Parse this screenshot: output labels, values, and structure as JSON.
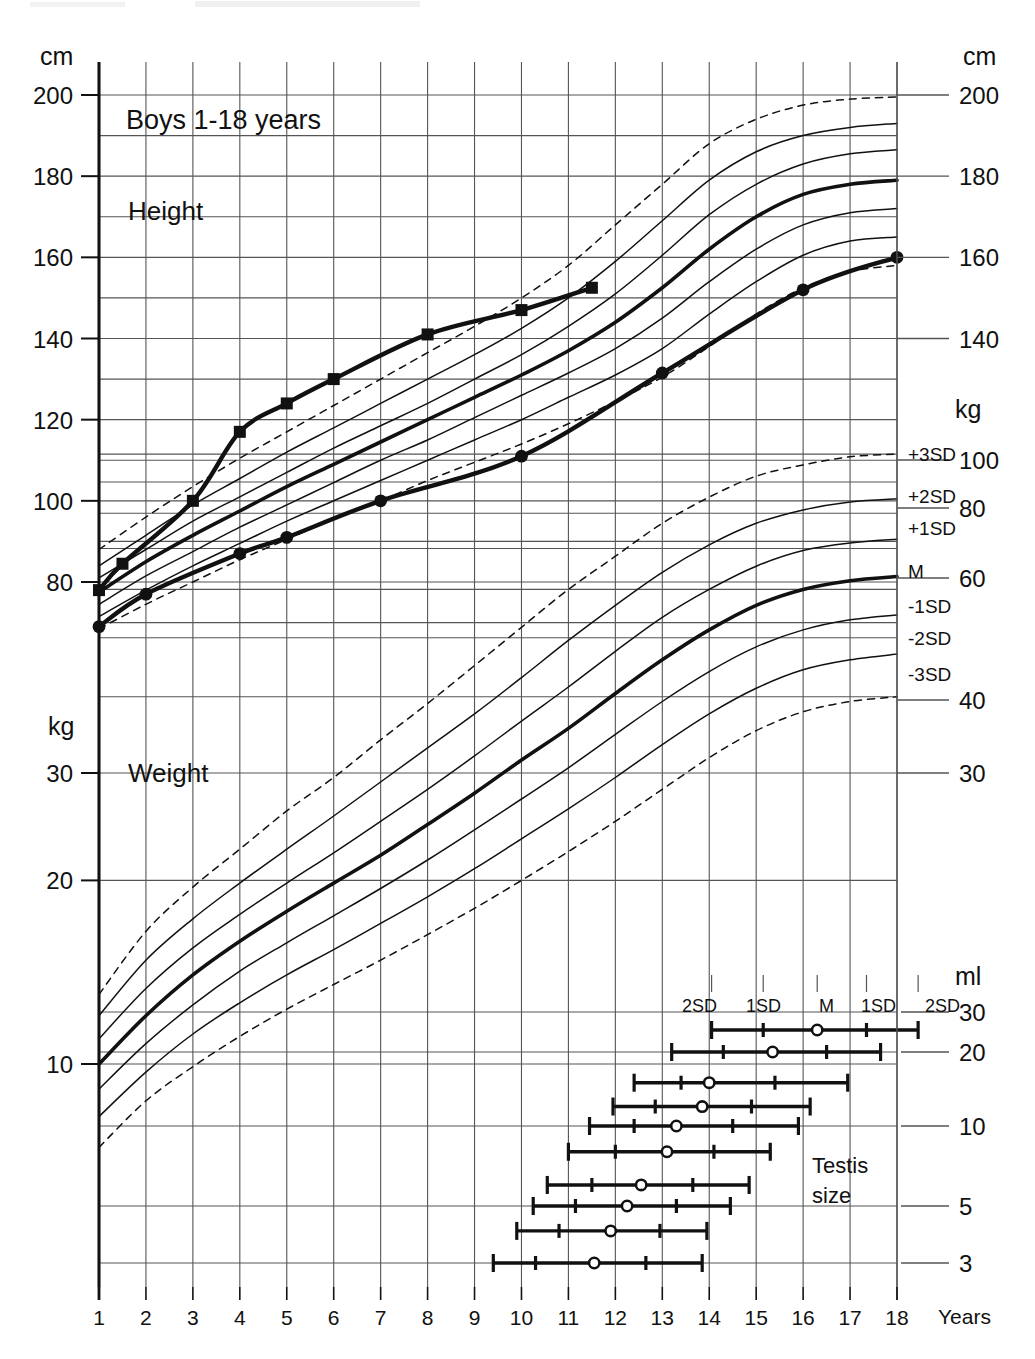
{
  "chart_data": {
    "type": "line",
    "title": "Boys 1-18 years",
    "xlabel": "Years",
    "x_ticks": [
      1,
      2,
      3,
      4,
      5,
      6,
      7,
      8,
      9,
      10,
      11,
      12,
      13,
      14,
      15,
      16,
      17,
      18
    ],
    "xlim": [
      1,
      18
    ],
    "grid": true,
    "panels": [
      {
        "name": "height",
        "section_label": "Height",
        "unit_left": "cm",
        "unit_right": "cm",
        "ylabel_ticks_left": [
          200,
          180,
          160,
          140,
          120,
          100,
          80
        ],
        "ylabel_ticks_right": [
          200,
          180,
          160,
          140
        ],
        "ylim": [
          68,
          205
        ],
        "reference_legend": [
          "+3SD",
          "+2SD",
          "+1SD",
          "M",
          "-1SD",
          "-2SD",
          "-3SD"
        ],
        "reference_curves": [
          {
            "name": "+3SD",
            "style": "dashed",
            "values": [
              88.0,
              96.0,
              103.5,
              110.5,
              117.0,
              123.5,
              130.0,
              136.5,
              143.0,
              150.0,
              158.0,
              168.0,
              178.0,
              188.0,
              194.0,
              197.5,
              199.0,
              199.5
            ]
          },
          {
            "name": "+2SD",
            "style": "solid",
            "values": [
              84.0,
              91.5,
              99.0,
              105.5,
              112.0,
              118.0,
              124.0,
              130.0,
              136.0,
              142.5,
              150.0,
              159.0,
              169.0,
              179.0,
              186.0,
              190.0,
              192.0,
              193.0
            ]
          },
          {
            "name": "+1SD",
            "style": "solid",
            "values": [
              81.0,
              88.0,
              95.0,
              101.0,
              107.0,
              113.0,
              118.5,
              124.0,
              130.0,
              136.0,
              143.0,
              151.0,
              160.5,
              170.5,
              178.0,
              183.0,
              185.5,
              186.5
            ]
          },
          {
            "name": "M",
            "style": "bold",
            "values": [
              77.5,
              85.0,
              91.5,
              97.5,
              103.5,
              109.0,
              114.5,
              120.0,
              125.5,
              131.0,
              137.0,
              144.0,
              152.5,
              162.0,
              170.0,
              175.5,
              178.0,
              179.0
            ]
          },
          {
            "name": "-1SD",
            "style": "solid",
            "values": [
              74.5,
              81.5,
              87.5,
              93.5,
              99.0,
              104.5,
              110.0,
              115.0,
              120.5,
              126.0,
              131.5,
              137.5,
              145.0,
              154.0,
              162.0,
              168.0,
              171.0,
              172.0
            ]
          },
          {
            "name": "-2SD",
            "style": "solid",
            "values": [
              71.5,
              78.0,
              84.0,
              89.5,
              95.0,
              100.0,
              105.0,
              110.0,
              115.0,
              120.0,
              125.5,
              131.0,
              137.5,
              146.0,
              154.0,
              160.5,
              164.0,
              165.0
            ]
          },
          {
            "name": "-3SD",
            "style": "dashed",
            "values": [
              68.5,
              74.5,
              80.0,
              85.5,
              90.5,
              95.5,
              100.0,
              105.0,
              109.5,
              114.0,
              119.0,
              124.5,
              130.5,
              138.0,
              146.0,
              152.5,
              156.5,
              158.0
            ]
          }
        ],
        "patient_series": [
          {
            "name": "patient-height-sibling",
            "marker": "square",
            "points": [
              [
                1.0,
                78.0
              ],
              [
                1.5,
                84.5
              ],
              [
                3.0,
                100.0
              ],
              [
                4.0,
                117.0
              ],
              [
                5.0,
                124.0
              ],
              [
                6.0,
                130.0
              ],
              [
                8.0,
                141.0
              ],
              [
                10.0,
                147.0
              ],
              [
                11.5,
                152.5
              ]
            ]
          },
          {
            "name": "patient-height-index",
            "marker": "circle",
            "points": [
              [
                1.0,
                69.0
              ],
              [
                2.0,
                77.0
              ],
              [
                4.0,
                87.0
              ],
              [
                5.0,
                91.0
              ],
              [
                7.0,
                100.0
              ],
              [
                10.0,
                111.0
              ],
              [
                13.0,
                131.5
              ],
              [
                16.0,
                152.0
              ],
              [
                18.0,
                160.0
              ]
            ]
          }
        ]
      },
      {
        "name": "weight",
        "section_label": "Weight",
        "unit_left": "kg",
        "unit_right": "kg",
        "ylabel_ticks_left": [
          30,
          20,
          10
        ],
        "ylabel_ticks_right": [
          100,
          80,
          60,
          40,
          30
        ],
        "scale": "log",
        "ylim": [
          7,
          115
        ],
        "reference_legend": [
          "+3SD",
          "+2SD",
          "+1SD",
          "M",
          "-1SD",
          "-2SD",
          "-3SD"
        ],
        "reference_curves": [
          {
            "name": "+3SD",
            "style": "dashed",
            "values": [
              13.0,
              16.5,
              19.5,
              22.5,
              26.0,
              29.5,
              34.0,
              39.0,
              45.0,
              52.0,
              60.0,
              68.0,
              77.0,
              85.0,
              92.0,
              96.0,
              99.0,
              100.0
            ]
          },
          {
            "name": "+2SD",
            "style": "solid",
            "values": [
              12.0,
              14.8,
              17.3,
              19.8,
              22.5,
              25.5,
              29.0,
              33.0,
              37.5,
              43.0,
              49.5,
              56.5,
              64.0,
              71.0,
              77.0,
              81.0,
              83.5,
              84.5
            ]
          },
          {
            "name": "+1SD",
            "style": "solid",
            "values": [
              11.0,
              13.3,
              15.5,
              17.6,
              19.8,
              22.2,
              25.0,
              28.2,
              32.0,
              36.5,
              41.5,
              47.5,
              54.0,
              60.0,
              65.5,
              69.5,
              71.5,
              72.5
            ]
          },
          {
            "name": "M",
            "style": "bold",
            "values": [
              10.0,
              12.0,
              14.0,
              15.9,
              17.8,
              19.8,
              22.0,
              24.7,
              27.8,
              31.5,
              35.5,
              40.5,
              46.0,
              51.5,
              56.5,
              60.0,
              62.0,
              63.0
            ]
          },
          {
            "name": "-1SD",
            "style": "solid",
            "values": [
              9.1,
              10.8,
              12.5,
              14.2,
              15.8,
              17.5,
              19.4,
              21.6,
              24.2,
              27.2,
              30.6,
              34.7,
              39.3,
              44.0,
              48.3,
              51.5,
              53.5,
              54.5
            ]
          },
          {
            "name": "-2SD",
            "style": "solid",
            "values": [
              8.2,
              9.7,
              11.2,
              12.6,
              14.0,
              15.4,
              17.0,
              18.8,
              20.9,
              23.4,
              26.2,
              29.5,
              33.4,
              37.5,
              41.3,
              44.3,
              46.0,
              47.0
            ]
          },
          {
            "name": "-3SD",
            "style": "dashed",
            "values": [
              7.3,
              8.7,
              9.9,
              11.1,
              12.3,
              13.5,
              14.8,
              16.3,
              18.0,
              20.0,
              22.3,
              25.0,
              28.2,
              31.8,
              35.2,
              37.8,
              39.3,
              40.0
            ]
          }
        ],
        "patient_series": []
      },
      {
        "name": "testis",
        "section_label": "Testis size",
        "unit_right": "ml",
        "ylabel_ticks_right": [
          30,
          20,
          10,
          5,
          3
        ],
        "header_labels": [
          "2SD",
          "1SD",
          "M",
          "1SD",
          "2SD"
        ],
        "rows": [
          {
            "volume_ml": 25,
            "minus2sd": 14.05,
            "minus1sd": 15.15,
            "median": 16.3,
            "plus1sd": 17.35,
            "plus2sd": 18.45
          },
          {
            "volume_ml": 20,
            "minus2sd": 13.2,
            "minus1sd": 14.3,
            "median": 15.35,
            "plus1sd": 16.5,
            "plus2sd": 17.65
          },
          {
            "volume_ml": 15,
            "minus2sd": 12.4,
            "minus1sd": 13.4,
            "median": 14.0,
            "plus1sd": 15.4,
            "plus2sd": 16.95
          },
          {
            "volume_ml": 12,
            "minus2sd": 11.95,
            "minus1sd": 12.85,
            "median": 13.85,
            "plus1sd": 14.9,
            "plus2sd": 16.15
          },
          {
            "volume_ml": 10,
            "minus2sd": 11.45,
            "minus1sd": 12.4,
            "median": 13.3,
            "plus1sd": 14.5,
            "plus2sd": 15.9
          },
          {
            "volume_ml": 8,
            "minus2sd": 11.0,
            "minus1sd": 12.0,
            "median": 13.1,
            "plus1sd": 14.1,
            "plus2sd": 15.3
          },
          {
            "volume_ml": 6,
            "minus2sd": 10.55,
            "minus1sd": 11.5,
            "median": 12.55,
            "plus1sd": 13.65,
            "plus2sd": 14.85
          },
          {
            "volume_ml": 5,
            "minus2sd": 10.25,
            "minus1sd": 11.15,
            "median": 12.25,
            "plus1sd": 13.3,
            "plus2sd": 14.45
          },
          {
            "volume_ml": 4,
            "minus2sd": 9.9,
            "minus1sd": 10.8,
            "median": 11.9,
            "plus1sd": 12.95,
            "plus2sd": 13.95
          },
          {
            "volume_ml": 3,
            "minus2sd": 9.4,
            "minus1sd": 10.3,
            "median": 11.55,
            "plus1sd": 12.65,
            "plus2sd": 13.85
          }
        ]
      }
    ]
  },
  "labels": {
    "title": "Boys 1-18 years",
    "height_section": "Height",
    "weight_section": "Weight",
    "testis_line1": "Testis",
    "testis_line2": "size",
    "years": "Years",
    "cm_top_left": "cm",
    "cm_top_right": "cm",
    "kg_left": "kg",
    "kg_right": "kg",
    "ml_right": "ml"
  },
  "sd_legend": {
    "p3": "+3SD",
    "p2": "+2SD",
    "p1": "+1SD",
    "m": "M",
    "n1": "-1SD",
    "n2": "-2SD",
    "n3": "-3SD"
  },
  "testis_header": {
    "c1": "2SD",
    "c2": "1SD",
    "c3": "M",
    "c4": "1SD",
    "c5": "2SD"
  },
  "colors": {
    "ink": "#111111",
    "grid": "#555555",
    "background": "#ffffff"
  }
}
